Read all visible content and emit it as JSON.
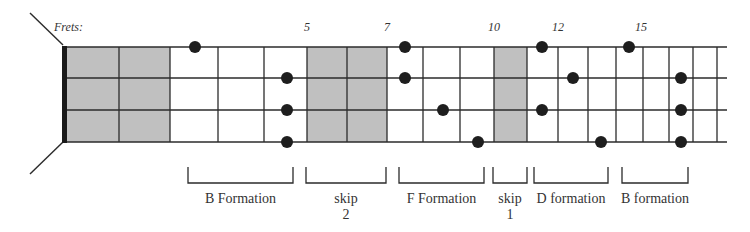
{
  "diagram": {
    "frets_label": "Frets:",
    "colors": {
      "line": "#2b2b2b",
      "shade": "#c0c0c0",
      "dot": "#1e1e1e",
      "nut": "#1a1a1a",
      "text": "#333333"
    },
    "strings_y": [
      47,
      78,
      110,
      142
    ],
    "nut_x": 64,
    "string_end_x": 727,
    "fret_x": [
      119,
      170,
      218,
      264,
      307,
      347,
      387,
      423,
      460,
      494,
      527,
      558,
      588,
      616,
      643,
      669,
      693,
      717
    ],
    "shaded_regions": [
      {
        "x1": 66,
        "x2": 170
      },
      {
        "x1": 307,
        "x2": 387
      },
      {
        "x1": 494,
        "x2": 527
      }
    ],
    "fret_numbers": [
      {
        "label": "5",
        "x": 307
      },
      {
        "label": "7",
        "x": 387
      },
      {
        "label": "10",
        "x": 494
      },
      {
        "label": "12",
        "x": 558
      },
      {
        "label": "15",
        "x": 641
      }
    ],
    "dots": [
      {
        "x": 195,
        "string": 0
      },
      {
        "x": 287,
        "string": 1
      },
      {
        "x": 287,
        "string": 2
      },
      {
        "x": 287,
        "string": 3
      },
      {
        "x": 405,
        "string": 0
      },
      {
        "x": 405,
        "string": 1
      },
      {
        "x": 443,
        "string": 2
      },
      {
        "x": 478,
        "string": 3
      },
      {
        "x": 542,
        "string": 0
      },
      {
        "x": 573,
        "string": 1
      },
      {
        "x": 542,
        "string": 2
      },
      {
        "x": 601,
        "string": 3
      },
      {
        "x": 629,
        "string": 0
      },
      {
        "x": 681,
        "string": 1
      },
      {
        "x": 681,
        "string": 2
      },
      {
        "x": 681,
        "string": 3
      }
    ],
    "brackets": [
      {
        "x1": 188,
        "x2": 293,
        "line1": "B Formation",
        "line2": ""
      },
      {
        "x1": 306,
        "x2": 386,
        "line1": "skip",
        "line2": "2"
      },
      {
        "x1": 399,
        "x2": 484,
        "line1": "F Formation",
        "line2": ""
      },
      {
        "x1": 493,
        "x2": 527,
        "line1": "skip",
        "line2": "1"
      },
      {
        "x1": 534,
        "x2": 608,
        "line1": "D formation",
        "line2": ""
      },
      {
        "x1": 622,
        "x2": 688,
        "line1": "B formation",
        "line2": ""
      }
    ]
  }
}
